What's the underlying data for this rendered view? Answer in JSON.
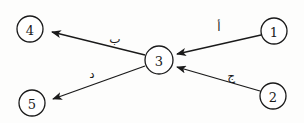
{
  "diagram": {
    "type": "directed-graph",
    "nodes": [
      {
        "id": "1",
        "label": "1",
        "x": 274,
        "y": 31,
        "r": 13
      },
      {
        "id": "2",
        "label": "2",
        "x": 273,
        "y": 96,
        "r": 13
      },
      {
        "id": "3",
        "label": "3",
        "x": 159,
        "y": 60,
        "r": 14
      },
      {
        "id": "4",
        "label": "4",
        "x": 30,
        "y": 29,
        "r": 13
      },
      {
        "id": "5",
        "label": "5",
        "x": 32,
        "y": 103,
        "r": 13
      }
    ],
    "edges": [
      {
        "from": "1",
        "to": "3",
        "label": "أ",
        "x1": 261,
        "y1": 35,
        "x2": 177,
        "y2": 54,
        "lx": 219,
        "ly": 27
      },
      {
        "from": "2",
        "to": "3",
        "label": "ج",
        "x1": 260,
        "y1": 91,
        "x2": 177,
        "y2": 67,
        "lx": 231,
        "ly": 76
      },
      {
        "from": "3",
        "to": "4",
        "label": "ب",
        "x1": 145,
        "y1": 55,
        "x2": 52,
        "y2": 32,
        "lx": 115,
        "ly": 39
      },
      {
        "from": "3",
        "to": "5",
        "label": "د",
        "x1": 145,
        "y1": 66,
        "x2": 53,
        "y2": 99,
        "lx": 92,
        "ly": 74
      }
    ],
    "colors": {
      "stroke": "#1a1a1a",
      "background": "#fdfdfc"
    }
  }
}
